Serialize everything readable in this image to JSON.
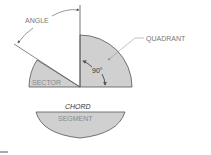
{
  "figure": {
    "labels": {
      "angle": "ANGLE",
      "quadrant": "QUADRANT",
      "sector": "SECTOR",
      "right_angle": "90°",
      "chord": "CHORD",
      "segment": "SEGMENT"
    },
    "colors": {
      "fill": "#d0d0d0",
      "stroke": "#555555",
      "leader": "#888888",
      "background": "#ffffff"
    }
  }
}
